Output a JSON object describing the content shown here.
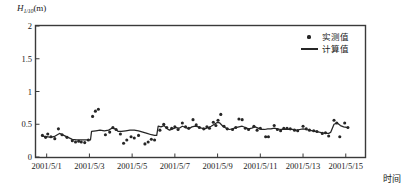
{
  "chart_data": {
    "type": "scatter",
    "title": "",
    "ylabel_main": "H",
    "ylabel_sub": "1/10",
    "ylabel_unit": "(m)",
    "xlabel": "时间",
    "ylim": [
      0,
      2
    ],
    "yticks": [
      "0",
      "0.5",
      "1",
      "1.5",
      "2"
    ],
    "ytick_values": [
      0,
      0.5,
      1,
      1.5,
      2
    ],
    "xtick_labels": [
      "2001/5/1",
      "2001/5/3",
      "2001/5/5",
      "2001/5/7",
      "2001/5/9",
      "2001/5/11",
      "2001/5/13",
      "2001/5/15"
    ],
    "xtick_days": [
      1,
      3,
      5,
      7,
      9,
      11,
      13,
      15
    ],
    "xlim_days": [
      0.5,
      15.9
    ],
    "grid": false,
    "legend_position": "top-right",
    "series": [
      {
        "name": "实测值",
        "type": "scatter",
        "marker": "dot",
        "color": "#262626",
        "points": [
          [
            0.8,
            0.33
          ],
          [
            0.95,
            0.3
          ],
          [
            1.05,
            0.35
          ],
          [
            1.2,
            0.31
          ],
          [
            1.38,
            0.28
          ],
          [
            1.55,
            0.43
          ],
          [
            1.72,
            0.34
          ],
          [
            1.95,
            0.3
          ],
          [
            2.2,
            0.25
          ],
          [
            2.35,
            0.23
          ],
          [
            2.5,
            0.24
          ],
          [
            2.62,
            0.23
          ],
          [
            2.78,
            0.22
          ],
          [
            2.95,
            0.26
          ],
          [
            3.15,
            0.62
          ],
          [
            3.28,
            0.7
          ],
          [
            3.42,
            0.73
          ],
          [
            3.75,
            0.34
          ],
          [
            3.95,
            0.38
          ],
          [
            4.1,
            0.45
          ],
          [
            4.25,
            0.42
          ],
          [
            4.45,
            0.35
          ],
          [
            4.6,
            0.21
          ],
          [
            4.75,
            0.26
          ],
          [
            4.95,
            0.31
          ],
          [
            5.1,
            0.29
          ],
          [
            5.3,
            0.33
          ],
          [
            5.6,
            0.2
          ],
          [
            5.75,
            0.23
          ],
          [
            5.9,
            0.27
          ],
          [
            6.05,
            0.26
          ],
          [
            6.3,
            0.41
          ],
          [
            6.48,
            0.5
          ],
          [
            6.62,
            0.45
          ],
          [
            6.85,
            0.44
          ],
          [
            7.0,
            0.46
          ],
          [
            7.15,
            0.42
          ],
          [
            7.35,
            0.52
          ],
          [
            7.5,
            0.46
          ],
          [
            7.65,
            0.44
          ],
          [
            7.85,
            0.57
          ],
          [
            8.0,
            0.49
          ],
          [
            8.15,
            0.45
          ],
          [
            8.35,
            0.43
          ],
          [
            8.5,
            0.46
          ],
          [
            8.62,
            0.44
          ],
          [
            8.8,
            0.53
          ],
          [
            8.92,
            0.48
          ],
          [
            9.02,
            0.56
          ],
          [
            9.15,
            0.65
          ],
          [
            9.3,
            0.47
          ],
          [
            9.45,
            0.43
          ],
          [
            9.7,
            0.42
          ],
          [
            9.85,
            0.45
          ],
          [
            10.0,
            0.58
          ],
          [
            10.15,
            0.57
          ],
          [
            10.3,
            0.44
          ],
          [
            10.45,
            0.42
          ],
          [
            10.7,
            0.47
          ],
          [
            10.85,
            0.41
          ],
          [
            11.0,
            0.44
          ],
          [
            11.25,
            0.31
          ],
          [
            11.38,
            0.31
          ],
          [
            11.65,
            0.48
          ],
          [
            11.8,
            0.42
          ],
          [
            11.95,
            0.4
          ],
          [
            12.1,
            0.44
          ],
          [
            12.25,
            0.44
          ],
          [
            12.4,
            0.43
          ],
          [
            12.6,
            0.41
          ],
          [
            12.75,
            0.4
          ],
          [
            13.0,
            0.47
          ],
          [
            13.15,
            0.43
          ],
          [
            13.3,
            0.41
          ],
          [
            13.5,
            0.4
          ],
          [
            13.65,
            0.39
          ],
          [
            13.9,
            0.36
          ],
          [
            14.05,
            0.37
          ],
          [
            14.2,
            0.32
          ],
          [
            14.45,
            0.56
          ],
          [
            14.58,
            0.52
          ],
          [
            14.72,
            0.31
          ],
          [
            14.95,
            0.52
          ],
          [
            15.1,
            0.45
          ]
        ]
      },
      {
        "name": "计算值",
        "type": "line",
        "color": "#262626",
        "points": [
          [
            0.8,
            0.32
          ],
          [
            1.0,
            0.31
          ],
          [
            1.2,
            0.3
          ],
          [
            1.4,
            0.32
          ],
          [
            1.6,
            0.36
          ],
          [
            1.8,
            0.33
          ],
          [
            2.0,
            0.3
          ],
          [
            2.2,
            0.27
          ],
          [
            2.4,
            0.26
          ],
          [
            2.6,
            0.26
          ],
          [
            2.8,
            0.26
          ],
          [
            3.0,
            0.26
          ],
          [
            3.05,
            0.26
          ],
          [
            3.1,
            0.39
          ],
          [
            3.3,
            0.4
          ],
          [
            3.5,
            0.41
          ],
          [
            3.7,
            0.4
          ],
          [
            3.9,
            0.41
          ],
          [
            4.05,
            0.44
          ],
          [
            4.2,
            0.43
          ],
          [
            4.35,
            0.39
          ],
          [
            4.5,
            0.39
          ],
          [
            4.7,
            0.4
          ],
          [
            4.9,
            0.41
          ],
          [
            5.1,
            0.41
          ],
          [
            5.3,
            0.4
          ],
          [
            5.5,
            0.38
          ],
          [
            5.7,
            0.36
          ],
          [
            5.9,
            0.34
          ],
          [
            6.05,
            0.33
          ],
          [
            6.15,
            0.33
          ],
          [
            6.22,
            0.47
          ],
          [
            6.35,
            0.46
          ],
          [
            6.5,
            0.48
          ],
          [
            6.6,
            0.44
          ],
          [
            6.75,
            0.41
          ],
          [
            6.9,
            0.43
          ],
          [
            7.05,
            0.45
          ],
          [
            7.2,
            0.44
          ],
          [
            7.35,
            0.47
          ],
          [
            7.5,
            0.45
          ],
          [
            7.65,
            0.43
          ],
          [
            7.8,
            0.46
          ],
          [
            7.95,
            0.47
          ],
          [
            8.1,
            0.46
          ],
          [
            8.25,
            0.44
          ],
          [
            8.4,
            0.43
          ],
          [
            8.55,
            0.45
          ],
          [
            8.7,
            0.47
          ],
          [
            8.85,
            0.5
          ],
          [
            9.0,
            0.53
          ],
          [
            9.1,
            0.52
          ],
          [
            9.25,
            0.47
          ],
          [
            9.4,
            0.44
          ],
          [
            9.55,
            0.42
          ],
          [
            9.7,
            0.43
          ],
          [
            9.85,
            0.45
          ],
          [
            10.0,
            0.46
          ],
          [
            10.15,
            0.47
          ],
          [
            10.3,
            0.45
          ],
          [
            10.45,
            0.43
          ],
          [
            10.6,
            0.44
          ],
          [
            10.75,
            0.46
          ],
          [
            10.9,
            0.44
          ],
          [
            11.05,
            0.42
          ],
          [
            11.2,
            0.42
          ],
          [
            11.35,
            0.43
          ],
          [
            11.5,
            0.43
          ],
          [
            11.65,
            0.44
          ],
          [
            11.8,
            0.43
          ],
          [
            11.95,
            0.42
          ],
          [
            12.1,
            0.42
          ],
          [
            12.25,
            0.42
          ],
          [
            12.4,
            0.42
          ],
          [
            12.55,
            0.42
          ],
          [
            12.7,
            0.41
          ],
          [
            12.85,
            0.42
          ],
          [
            13.0,
            0.43
          ],
          [
            13.15,
            0.42
          ],
          [
            13.3,
            0.41
          ],
          [
            13.45,
            0.4
          ],
          [
            13.6,
            0.39
          ],
          [
            13.75,
            0.38
          ],
          [
            13.9,
            0.37
          ],
          [
            14.05,
            0.36
          ],
          [
            14.2,
            0.36
          ],
          [
            14.3,
            0.38
          ],
          [
            14.45,
            0.5
          ],
          [
            14.6,
            0.52
          ],
          [
            14.75,
            0.48
          ],
          [
            14.9,
            0.46
          ],
          [
            15.1,
            0.45
          ]
        ]
      }
    ]
  },
  "legend": {
    "items": [
      {
        "label": "实测值",
        "key": "dot-marker"
      },
      {
        "label": "计算值",
        "key": "line-marker"
      }
    ]
  },
  "colors": {
    "ink": "#1a1a1a",
    "axis": "#3a3a3a",
    "data": "#262626"
  }
}
